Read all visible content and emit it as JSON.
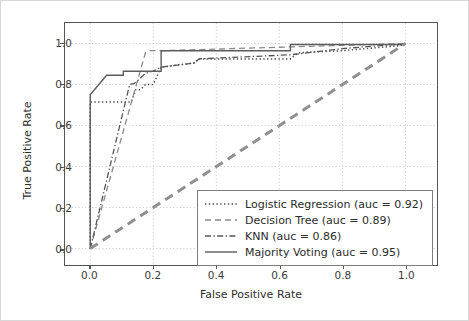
{
  "chart_data": {
    "type": "line",
    "title": "",
    "xlabel": "False Positive Rate",
    "ylabel": "True Positive Rate",
    "xlim": [
      -0.08,
      1.1
    ],
    "ylim": [
      -0.08,
      1.1
    ],
    "xticks": [
      "0.0",
      "0.2",
      "0.4",
      "0.6",
      "0.8",
      "1.0"
    ],
    "xtick_values": [
      0.0,
      0.2,
      0.4,
      0.6,
      0.8,
      1.0
    ],
    "yticks": [
      "0.0",
      "0.2",
      "0.4",
      "0.6",
      "0.8",
      "1.0"
    ],
    "ytick_values": [
      0.0,
      0.2,
      0.4,
      0.6,
      0.8,
      1.0
    ],
    "grid": true,
    "grid_style": "dotted",
    "grid_color": "#c9c9c9",
    "legend_position": "lower right",
    "series": [
      {
        "name": "Logistic Regression (auc = 0.92)",
        "label": "Logistic Regression (auc = 0.92)",
        "auc": 0.92,
        "linestyle": "dotted",
        "color": "#4d4d4d",
        "x": [
          0.0,
          0.0,
          0.13,
          0.145,
          0.16,
          0.175,
          0.2,
          0.225,
          0.225,
          0.33,
          0.345,
          0.635,
          0.66,
          0.8,
          0.985,
          1.0
        ],
        "y": [
          0.0,
          0.715,
          0.715,
          0.775,
          0.775,
          0.8,
          0.8,
          0.885,
          0.885,
          0.905,
          0.925,
          0.925,
          0.955,
          0.965,
          0.99,
          1.0
        ]
      },
      {
        "name": "Decision Tree (auc = 0.89)",
        "label": "Decision Tree (auc = 0.89)",
        "auc": 0.89,
        "linestyle": "dashed",
        "color": "#8a8a8a",
        "x": [
          0.0,
          0.175,
          0.185,
          0.225,
          1.0
        ],
        "y": [
          0.0,
          0.955,
          0.965,
          0.965,
          1.0
        ]
      },
      {
        "name": "KNN (auc = 0.86)",
        "label": "KNN (auc = 0.86)",
        "auc": 0.86,
        "linestyle": "dashdot",
        "color": "#555555",
        "x": [
          0.0,
          0.125,
          0.14,
          0.155,
          0.175,
          0.2,
          0.225,
          0.33,
          0.345,
          0.635,
          0.8,
          1.0
        ],
        "y": [
          0.0,
          0.8,
          0.805,
          0.825,
          0.855,
          0.865,
          0.885,
          0.905,
          0.925,
          0.945,
          0.975,
          1.0
        ]
      },
      {
        "name": "Majority Voting (auc = 0.95)",
        "label": "Majority Voting (auc = 0.95)",
        "auc": 0.95,
        "linestyle": "solid",
        "color": "#5c5c5c",
        "x": [
          0.0,
          0.0,
          0.052,
          0.105,
          0.105,
          0.225,
          0.225,
          0.635,
          0.635,
          1.0
        ],
        "y": [
          0.0,
          0.75,
          0.845,
          0.845,
          0.865,
          0.865,
          0.965,
          0.965,
          0.995,
          0.995
        ]
      },
      {
        "name": "diagonal-reference",
        "label": "",
        "auc": 0.5,
        "linestyle": "dashed-thick",
        "color": "#8f8f8f",
        "x": [
          0.0,
          1.0
        ],
        "y": [
          0.0,
          1.0
        ]
      }
    ]
  },
  "axes": {
    "xlabel": "False Positive Rate",
    "ylabel": "True Positive Rate"
  },
  "legend": {
    "items": [
      {
        "label": "Logistic Regression (auc = 0.92)",
        "style": "dotted"
      },
      {
        "label": "Decision Tree (auc = 0.89)",
        "style": "dashed"
      },
      {
        "label": "KNN (auc = 0.86)",
        "style": "dashdot"
      },
      {
        "label": "Majority Voting (auc = 0.95)",
        "style": "solid"
      }
    ]
  }
}
